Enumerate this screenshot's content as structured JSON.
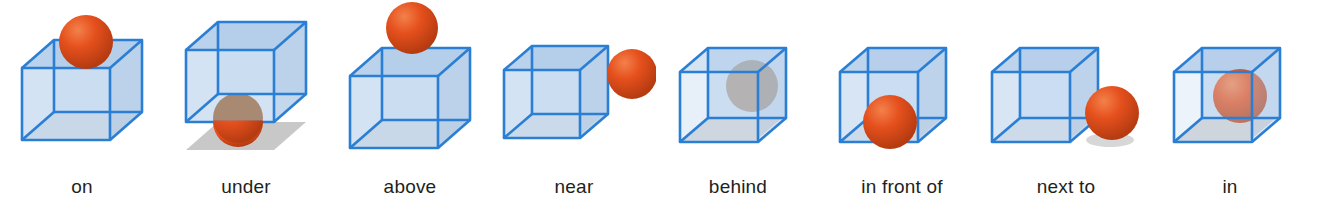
{
  "figure": {
    "kind": "spatial-prepositions-diagram",
    "background_color": "#ffffff",
    "object_colors": {
      "cube_edge": "#2a7fd4",
      "cube_face": "#c3d8ef",
      "cube_face_dark": "#a9c7e6",
      "sphere": "#e5501d",
      "sphere_shade": "#b53b11",
      "sphere_highlight": "#f3814b",
      "sphere_occluded": "#a08a74",
      "sphere_occluded_shade": "#7d6a57",
      "ground_shadow": "#a6a6a6",
      "caption_text": "#231f20"
    },
    "panel_count": 8
  },
  "panels": [
    {
      "id": "on",
      "label": "on",
      "sphere_position": "resting on top face of cube",
      "cube_position": "on ground",
      "sphere_state": "visible",
      "shadow": "under cube"
    },
    {
      "id": "under",
      "label": "under",
      "sphere_position": "on ground beneath floating cube",
      "cube_position": "floating above sphere",
      "sphere_state": "visible",
      "shadow": "under sphere"
    },
    {
      "id": "above",
      "label": "above",
      "sphere_position": "floating high above cube with gap",
      "cube_position": "on ground",
      "sphere_state": "visible",
      "shadow": "under cube"
    },
    {
      "id": "near",
      "label": "near",
      "sphere_position": "floating to the right of cube, separated by gap",
      "cube_position": "on ground",
      "sphere_state": "visible",
      "shadow": "under cube"
    },
    {
      "id": "behind",
      "label": "behind",
      "sphere_position": "inside view, occluded behind cube faces",
      "cube_position": "on ground",
      "sphere_state": "occluded",
      "shadow": "under cube"
    },
    {
      "id": "in-front-of",
      "label": "in front of",
      "sphere_position": "on ground in front of cube, overlapping front-lower-left",
      "cube_position": "on ground",
      "sphere_state": "visible",
      "shadow": "under cube"
    },
    {
      "id": "next-to",
      "label": "next to",
      "sphere_position": "on ground touching right side of cube",
      "cube_position": "on ground",
      "sphere_state": "visible",
      "shadow": "under cube and sphere"
    },
    {
      "id": "in",
      "label": "in",
      "sphere_position": "inside the cube, in front of back faces",
      "cube_position": "on ground",
      "sphere_state": "visible",
      "shadow": "under cube"
    }
  ]
}
